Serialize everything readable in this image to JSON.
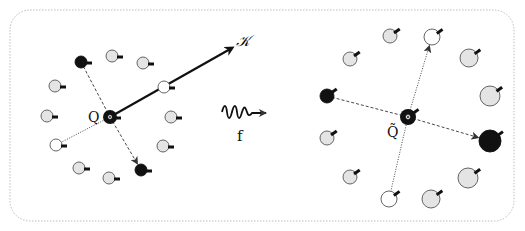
{
  "diagram": {
    "frame": {
      "x": 10,
      "y": 10,
      "width": 504,
      "height": 211,
      "radius": 20,
      "stroke": "#bdbdbd",
      "style": "dotted"
    },
    "colors": {
      "black": "#111111",
      "white": "#ffffff",
      "gray": "#e4e4e4",
      "outline": "#555555",
      "edge": "#333333"
    },
    "labels": {
      "left_center": "Q",
      "vector": "𝒦",
      "mapping": "f",
      "right_center": "Q̃"
    },
    "left_panel": {
      "center": {
        "x": 110,
        "y": 117,
        "r": 7,
        "fill": "black",
        "ring": true
      },
      "vector_arrow": {
        "x1": 110,
        "y1": 117,
        "x2": 232,
        "y2": 48
      },
      "nodes": [
        {
          "id": "L1",
          "x": 81,
          "y": 62,
          "r": 6,
          "fill": "black"
        },
        {
          "id": "L2",
          "x": 112,
          "y": 56,
          "r": 6,
          "fill": "gray"
        },
        {
          "id": "L3",
          "x": 143,
          "y": 63,
          "r": 6,
          "fill": "gray"
        },
        {
          "id": "L4",
          "x": 55,
          "y": 86,
          "r": 6,
          "fill": "gray"
        },
        {
          "id": "L5",
          "x": 164,
          "y": 87,
          "r": 6,
          "fill": "white"
        },
        {
          "id": "L6",
          "x": 47,
          "y": 116,
          "r": 6,
          "fill": "gray"
        },
        {
          "id": "L7",
          "x": 171,
          "y": 117,
          "r": 6,
          "fill": "gray"
        },
        {
          "id": "L8",
          "x": 56,
          "y": 145,
          "r": 6,
          "fill": "white"
        },
        {
          "id": "L9",
          "x": 163,
          "y": 146,
          "r": 6,
          "fill": "gray"
        },
        {
          "id": "L10",
          "x": 79,
          "y": 168,
          "r": 6,
          "fill": "gray"
        },
        {
          "id": "L11",
          "x": 141,
          "y": 170,
          "r": 6,
          "fill": "black"
        },
        {
          "id": "L12",
          "x": 109,
          "y": 178,
          "r": 6,
          "fill": "gray"
        }
      ],
      "edges": [
        {
          "from": "L1",
          "to": "center",
          "style": "dashed"
        },
        {
          "from": "center",
          "to": "L11",
          "style": "dashed",
          "arrow": true
        },
        {
          "from": "center",
          "to": "L8",
          "style": "dotted"
        }
      ]
    },
    "mapping_arrow": {
      "x1": 222,
      "y1": 113,
      "x2": 270,
      "y2": 113,
      "label_x": 240,
      "label_y": 140
    },
    "right_panel": {
      "center": {
        "x": 408,
        "y": 117,
        "r": 8,
        "fill": "black",
        "ring": true
      },
      "nodes": [
        {
          "id": "R1",
          "x": 390,
          "y": 36,
          "r": 7,
          "fill": "gray"
        },
        {
          "id": "R2",
          "x": 432,
          "y": 37,
          "r": 8,
          "fill": "white"
        },
        {
          "id": "R3",
          "x": 350,
          "y": 59,
          "r": 7,
          "fill": "gray"
        },
        {
          "id": "R4",
          "x": 469,
          "y": 58,
          "r": 9,
          "fill": "gray"
        },
        {
          "id": "R5",
          "x": 327,
          "y": 96,
          "r": 7,
          "fill": "black"
        },
        {
          "id": "R6",
          "x": 490,
          "y": 96,
          "r": 10,
          "fill": "gray"
        },
        {
          "id": "R7",
          "x": 327,
          "y": 138,
          "r": 7,
          "fill": "gray"
        },
        {
          "id": "R8",
          "x": 490,
          "y": 141,
          "r": 11,
          "fill": "black"
        },
        {
          "id": "R9",
          "x": 350,
          "y": 177,
          "r": 7,
          "fill": "gray"
        },
        {
          "id": "R10",
          "x": 468,
          "y": 178,
          "r": 10,
          "fill": "gray"
        },
        {
          "id": "R11",
          "x": 389,
          "y": 199,
          "r": 8,
          "fill": "white"
        },
        {
          "id": "R12",
          "x": 431,
          "y": 199,
          "r": 9,
          "fill": "gray"
        }
      ],
      "edges": [
        {
          "from": "R5",
          "to": "center",
          "style": "dashed"
        },
        {
          "from": "center",
          "to": "R8",
          "style": "dashed",
          "arrow": true
        },
        {
          "from": "R11",
          "to": "center",
          "style": "dotted"
        },
        {
          "from": "center",
          "to": "R2",
          "style": "dotted",
          "arrow": true
        }
      ]
    }
  }
}
